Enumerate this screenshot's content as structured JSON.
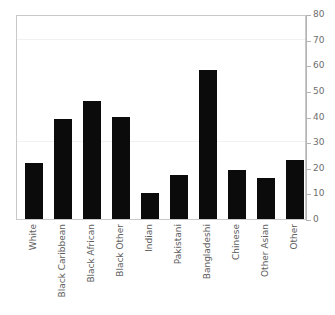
{
  "chart_data": {
    "type": "bar",
    "title": "",
    "subtitle": "",
    "xlabel": "",
    "ylabel": "",
    "categories": [
      "White",
      "Black Caribbean",
      "Black African",
      "Black Other",
      "Indian",
      "Pakistani",
      "Bangladeshi",
      "Chinese",
      "Other Asian",
      "Other"
    ],
    "values": [
      22,
      39,
      46,
      40,
      10,
      17,
      58,
      19,
      16,
      23
    ],
    "ylim": [
      0,
      80
    ],
    "ytick_labels": [
      "0",
      "10",
      "20",
      "30",
      "40",
      "50",
      "60",
      "70",
      "80"
    ],
    "ytick_values": [
      0,
      10,
      20,
      30,
      40,
      50,
      60,
      70,
      80
    ],
    "grid": true,
    "gridlines_at": [
      30,
      70
    ],
    "legend": null,
    "legend_position": "none",
    "axis_position": "right",
    "bar_color": "#0b0b0b",
    "frame_color": "#c9c9c9",
    "gridline_color": "#f2f0f0",
    "axis_color": "#b4b4b4",
    "tick_label_color": "#6e6e6e",
    "category_label_color": "#5e5e5e",
    "background_color": "#ffffff"
  }
}
